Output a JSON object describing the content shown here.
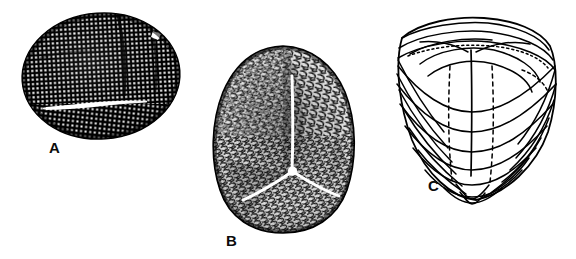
{
  "figure": {
    "background_color": "#ffffff",
    "ink_color": "#000000",
    "width": 576,
    "height": 259,
    "panel_count": 3
  },
  "panels": [
    {
      "id": "A",
      "label": "A",
      "label_x": 49,
      "label_y": 140,
      "caption": "Dark oval specimen with dense stippled (punctate) surface and a transverse white slit",
      "shape": "ellipse",
      "render_style": "stippled-dark",
      "fill_color": "#000000",
      "dot_color": "#ffffff",
      "center_x": 101,
      "center_y": 76,
      "radius_x": 79,
      "radius_y": 63,
      "rotation_deg": -4,
      "slit": {
        "name": "transverse-slit",
        "x1": 46,
        "y1": 107,
        "x2": 142,
        "y2": 101,
        "thickness": 3.6
      },
      "highlight_patch": {
        "name": "edge-highlight",
        "x": 154,
        "y": 33,
        "width": 8,
        "height": 7
      },
      "dot_spacing": 4.4,
      "dot_size": 2.1
    },
    {
      "id": "B",
      "label": "B",
      "label_x": 226,
      "label_y": 233,
      "caption": "Rounded-triangular spore in proximal view with reticulate sculpture and trilete (Y-shaped) mark",
      "shape": "rounded-triangle",
      "render_style": "reticulate-vermiculate",
      "fill_color": "#1a1a1a",
      "texture_color": "#ffffff",
      "center_x": 283,
      "center_y": 143,
      "radius_x": 64,
      "radius_y": 92,
      "trilete": {
        "name": "trilete-mark",
        "center_x": 292,
        "center_y": 172,
        "arm_length_up": 96,
        "arm_length_left": 62,
        "arm_length_right": 58,
        "thickness": 3.0,
        "color": "#ffffff"
      },
      "texture_density": 1450
    },
    {
      "id": "C",
      "label": "C",
      "label_x": 428,
      "label_y": 178,
      "caption": "Line-drawing reconstruction of the same spore showing contour lines, trilete suture and dashed hidden outlines",
      "shape": "rounded-triangle",
      "render_style": "contour-line-drawing",
      "stroke_color": "#000000",
      "fill_color": "#ffffff",
      "center_x": 469,
      "center_y": 105,
      "width": 182,
      "height": 190,
      "contour_count": 9,
      "has_dashed_hidden_lines": true,
      "has_dotted_lines": true,
      "suture": {
        "name": "trilete-suture",
        "x": 470,
        "y_top": 52,
        "y_bottom": 172
      }
    }
  ],
  "labels": {
    "a": "A",
    "b": "B",
    "c": "C",
    "font_size_px": 15
  }
}
